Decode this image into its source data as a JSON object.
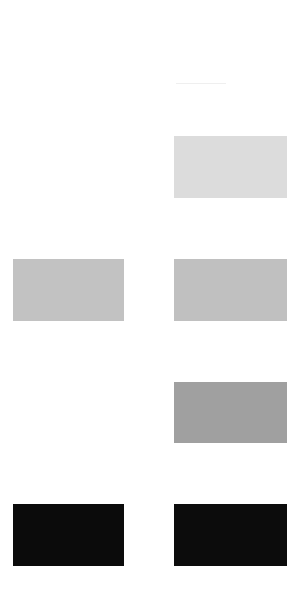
{
  "header": {
    "left_text": "",
    "right_text": ""
  },
  "swatches": [
    {
      "id": "r1-right",
      "row": 1,
      "column": "right",
      "color": "#dcdcdc"
    },
    {
      "id": "r2-left",
      "row": 2,
      "column": "left",
      "color": "#c2c2c2"
    },
    {
      "id": "r2-right",
      "row": 2,
      "column": "right",
      "color": "#c0c0c0"
    },
    {
      "id": "r3-right",
      "row": 3,
      "column": "right",
      "color": "#a0a0a0"
    },
    {
      "id": "r4-left",
      "row": 4,
      "column": "left",
      "color": "#0b0b0b"
    },
    {
      "id": "r4-right",
      "row": 4,
      "column": "right",
      "color": "#0c0c0c"
    }
  ],
  "styles": {
    "s0": "background:#dcdcdc",
    "s1": "background:#c2c2c2",
    "s2": "background:#c0c0c0",
    "s3": "background:#a0a0a0",
    "s4": "background:#0b0b0b",
    "s5": "background:#0c0c0c"
  }
}
